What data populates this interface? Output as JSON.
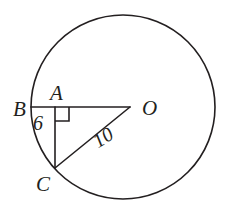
{
  "figure": {
    "type": "circle-geometry-diagram",
    "stroke_color": "#231f20",
    "background_color": "#ffffff",
    "circle": {
      "name": "main-circle",
      "center_x": 123,
      "center_y": 107,
      "radius": 92
    },
    "points": [
      {
        "id": "B",
        "label": "B",
        "x": 31,
        "y": 107,
        "label_x": 13,
        "label_y": 99
      },
      {
        "id": "A",
        "label": "A",
        "x": 55,
        "y": 107,
        "label_x": 50,
        "label_y": 83
      },
      {
        "id": "O",
        "label": "O",
        "x": 130,
        "y": 107,
        "label_x": 142,
        "label_y": 98
      },
      {
        "id": "C",
        "label": "C",
        "x": 55,
        "y": 168,
        "label_x": 36,
        "label_y": 174
      }
    ],
    "segments": [
      {
        "name": "segment-BO",
        "from": "B",
        "to": "O",
        "x1": 31,
        "y1": 107,
        "x2": 130,
        "y2": 107
      },
      {
        "name": "segment-AC",
        "from": "A",
        "to": "C",
        "x1": 55,
        "y1": 107,
        "x2": 55,
        "y2": 168
      },
      {
        "name": "segment-OC",
        "from": "O",
        "to": "C",
        "x1": 130,
        "y1": 107,
        "x2": 55,
        "y2": 168
      }
    ],
    "right_angle": {
      "name": "right-angle-marker-at-A",
      "vertex_x": 55,
      "vertex_y": 107,
      "size": 14,
      "direction": "down-right"
    },
    "measure_labels": [
      {
        "id": "len-6",
        "text": "6",
        "applies_to": "segment-AC-upper",
        "x": 33,
        "y": 113,
        "rotation": 0
      },
      {
        "id": "len-10",
        "text": "10",
        "applies_to": "segment-OC",
        "x": 89,
        "y": 134,
        "rotation": -32
      }
    ]
  }
}
